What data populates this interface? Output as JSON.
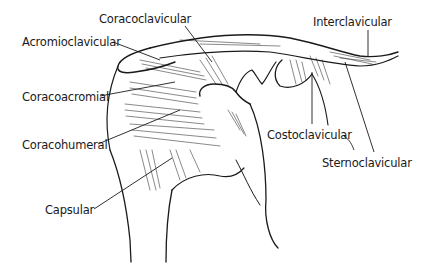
{
  "diagram": {
    "labels": [
      {
        "id": "coracoclavicular",
        "text": "Coracoclavicular",
        "x": 99,
        "y": 14
      },
      {
        "id": "acromioclavicular",
        "text": "Acromioclavicular",
        "x": 22,
        "y": 37
      },
      {
        "id": "interclavicular",
        "text": "Interclavicular",
        "x": 313,
        "y": 17
      },
      {
        "id": "coracoacromial",
        "text": "Coracoacromial",
        "x": 22,
        "y": 92
      },
      {
        "id": "coracohumeral",
        "text": "Coracohumeral",
        "x": 22,
        "y": 140
      },
      {
        "id": "costoclavicular",
        "text": "Costoclavicular",
        "x": 267,
        "y": 130
      },
      {
        "id": "sternoclavicular",
        "text": "Sternoclavicular",
        "x": 322,
        "y": 158
      },
      {
        "id": "capsular",
        "text": "Capsular",
        "x": 45,
        "y": 205
      }
    ],
    "colors": {
      "ink": "#1a1a1a",
      "background": "#ffffff"
    }
  }
}
